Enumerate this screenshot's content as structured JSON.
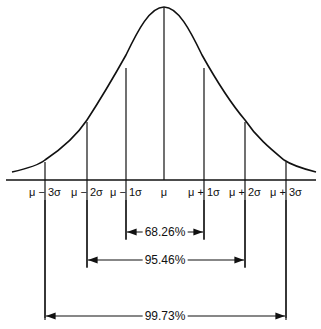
{
  "diagram": {
    "axis_labels": [
      "μ − 3σ",
      "μ − 2σ",
      "μ − 1σ",
      "μ",
      "μ + 1σ",
      "μ + 2σ",
      "μ + 3σ"
    ],
    "intervals": [
      {
        "label": "68.26%",
        "range": "μ ± 1σ"
      },
      {
        "label": "95.46%",
        "range": "μ ± 2σ"
      },
      {
        "label": "99.73%",
        "range": "μ ± 3σ"
      }
    ]
  }
}
